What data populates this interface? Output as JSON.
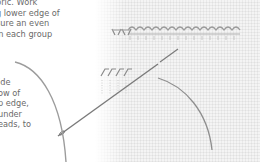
{
  "document": {
    "text_top": [
      "bric. Work",
      "g lower edge of",
      "sure an even",
      "in each group"
    ],
    "text_bottom": [
      "ide",
      "ow of",
      "p edge,",
      "under",
      "eads, to"
    ]
  },
  "illustration": {
    "subject": "hemstitching on fabric with needle and thread",
    "elements": [
      "fabric-weave",
      "stitched-thread-groups",
      "loose-stitches",
      "needle",
      "thread"
    ],
    "colors": {
      "fabric": "#f4f4f4",
      "thread": "#8a8a8a",
      "needle": "#7a7a7a",
      "text": "#6a6a6a"
    }
  }
}
